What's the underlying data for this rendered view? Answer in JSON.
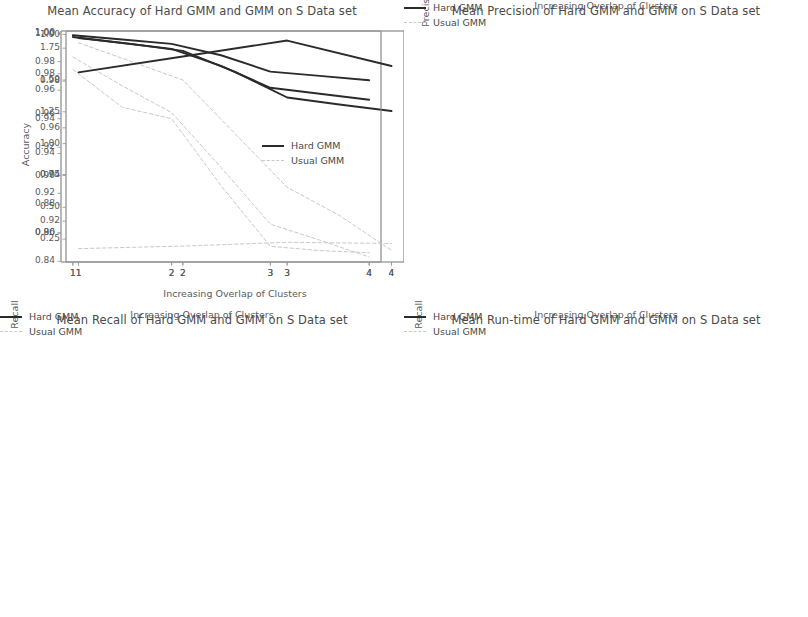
{
  "figure": {
    "background": "#ffffff",
    "series_colors": {
      "hard_gmm": "#2b2b2b",
      "usual_gmm": "#c9c9c9"
    },
    "xlabel": "Increasing Overlap of Clusters",
    "legend": {
      "hard": "Hard GMM",
      "usual": "Usual GMM"
    }
  },
  "panels": [
    {
      "id": "accuracy",
      "title": "Mean Accuracy of Hard GMM and GMM on S Data set",
      "ylabel": "Accuracy",
      "xlabel": "Increasing Overlap of Clusters",
      "xticks": [
        "1",
        "2",
        "3",
        "4"
      ],
      "yticks": [
        "1.00",
        "0.98",
        "0.96",
        "0.94",
        "0.92",
        "0.90",
        "0.88",
        "0.86",
        "0.84"
      ],
      "legend_items": [
        "Hard GMM",
        "Usual GMM"
      ]
    },
    {
      "id": "precision",
      "title": "Mean Precision of Hard GMM and GMM on S Data set",
      "ylabel": "Precision",
      "xlabel": "Increasing Overlap of Clusters",
      "xticks": [
        "1",
        "2",
        "3",
        "4"
      ],
      "yticks": [
        "1.00",
        "0.98",
        "0.96",
        "0.94",
        "0.92"
      ],
      "legend_items": [
        "Hard GMM",
        "Usual GMM"
      ]
    },
    {
      "id": "recall",
      "title": "Mean Recall of Hard GMM and GMM on S Data set",
      "ylabel": "Recall",
      "xlabel": "Increasing Overlap of Clusters",
      "xticks": [
        "1",
        "2",
        "3",
        "4"
      ],
      "yticks": [
        "1.00",
        "0.98",
        "0.96",
        "0.94",
        "0.92",
        "0.90"
      ],
      "legend_items": [
        "Hard GMM",
        "Usual GMM"
      ]
    },
    {
      "id": "runtime",
      "title": "Mean Run-time of Hard GMM and GMM on S Data set",
      "ylabel": "Recall",
      "xlabel": "Increasing Overlap of Clusters",
      "xticks": [
        "1",
        "2",
        "3",
        "4"
      ],
      "yticks": [
        "1.75",
        "1.50",
        "1.25",
        "1.00",
        "0.75",
        "0.50",
        "0.25"
      ],
      "legend_items": [
        "Hard GMM",
        "Usual GMM"
      ]
    }
  ],
  "chart_data": [
    {
      "type": "line",
      "id": "accuracy",
      "title": "Mean Accuracy of Hard GMM and GMM on S Data set",
      "xlabel": "Increasing Overlap of Clusters",
      "ylabel": "Accuracy",
      "x": [
        1,
        2,
        3,
        4
      ],
      "xticks": [
        1,
        2,
        3,
        4
      ],
      "yticks": [
        1.0,
        0.98,
        0.96,
        0.94,
        0.92,
        0.9,
        0.88,
        0.86,
        0.84
      ],
      "xlim": [
        0.88,
        4.12
      ],
      "ylim": [
        0.8395,
        1.0015
      ],
      "grid": false,
      "legend": "upper right",
      "series": [
        {
          "name": "Hard GMM",
          "style": "solid",
          "color": "#2b2b2b",
          "x": [
            1,
            1.5,
            2,
            2.5,
            3,
            3.5,
            4
          ],
          "values": [
            0.9985,
            0.9955,
            0.9925,
            0.9845,
            0.973,
            0.97,
            0.967
          ]
        },
        {
          "name": "Usual GMM",
          "style": "dashed",
          "color": "#c9c9c9",
          "x": [
            1,
            1.5,
            2,
            2.5,
            3,
            3.5,
            4
          ],
          "values": [
            0.9745,
            0.948,
            0.94,
            0.893,
            0.8505,
            0.8475,
            0.846
          ]
        }
      ]
    },
    {
      "type": "line",
      "id": "precision",
      "title": "Mean Precision of Hard GMM and GMM on S Data set",
      "xlabel": "Increasing Overlap of Clusters",
      "ylabel": "Precision",
      "x": [
        1,
        2,
        3,
        4
      ],
      "xticks": [
        1,
        2,
        3,
        4
      ],
      "yticks": [
        1.0,
        0.98,
        0.96,
        0.94,
        0.92
      ],
      "xlim": [
        0.88,
        4.12
      ],
      "ylim": [
        0.9025,
        1.0015
      ],
      "grid": false,
      "legend": "upper right",
      "series": [
        {
          "name": "Hard GMM",
          "style": "solid",
          "color": "#2b2b2b",
          "x": [
            1,
            1.5,
            2,
            2.5,
            3,
            3.5,
            4
          ],
          "values": [
            0.9985,
            0.996,
            0.993,
            0.984,
            0.973,
            0.97,
            0.9672
          ]
        },
        {
          "name": "Usual GMM",
          "style": "dashed",
          "color": "#c9c9c9",
          "x": [
            1,
            1.5,
            2,
            2.5,
            3,
            3.5,
            4
          ],
          "values": [
            0.9965,
            0.9885,
            0.9805,
            0.9575,
            0.9345,
            0.9225,
            0.9075
          ]
        }
      ]
    },
    {
      "type": "line",
      "id": "recall",
      "title": "Mean Recall of Hard GMM and GMM on S Data set",
      "xlabel": "Increasing Overlap of Clusters",
      "ylabel": "Recall",
      "x": [
        1,
        2,
        3,
        4
      ],
      "xticks": [
        1,
        2,
        3,
        4
      ],
      "yticks": [
        1.0,
        0.98,
        0.96,
        0.94,
        0.92,
        0.9
      ],
      "xlim": [
        0.88,
        4.12
      ],
      "ylim": [
        0.8855,
        1.0015
      ],
      "grid": false,
      "legend": "upper right",
      "series": [
        {
          "name": "Hard GMM",
          "style": "solid",
          "color": "#2b2b2b",
          "x": [
            1,
            1.5,
            2,
            2.5,
            3,
            3.5,
            4
          ],
          "values": [
            0.9985,
            0.9955,
            0.9925,
            0.984,
            0.973,
            0.97,
            0.967
          ]
        },
        {
          "name": "Usual GMM",
          "style": "dashed",
          "color": "#c9c9c9",
          "x": [
            1,
            1.5,
            2,
            2.5,
            3,
            3.5,
            4
          ],
          "values": [
            0.9885,
            0.974,
            0.9605,
            0.933,
            0.9045,
            0.8965,
            0.888
          ]
        }
      ]
    },
    {
      "type": "line",
      "id": "runtime",
      "title": "Mean Run-time of Hard GMM and GMM on S Data set",
      "xlabel": "Increasing Overlap of Clusters",
      "ylabel": "Recall",
      "x": [
        1,
        2,
        3,
        4
      ],
      "xticks": [
        1,
        2,
        3,
        4
      ],
      "yticks": [
        1.75,
        1.5,
        1.25,
        1.0,
        0.75,
        0.5,
        0.25
      ],
      "xlim": [
        0.88,
        4.12
      ],
      "ylim": [
        0.07,
        1.885
      ],
      "grid": false,
      "legend": "center right",
      "series": [
        {
          "name": "Hard GMM",
          "style": "solid",
          "color": "#2b2b2b",
          "x": [
            1,
            2,
            3,
            4
          ],
          "values": [
            1.56,
            1.685,
            1.81,
            1.61
          ]
        },
        {
          "name": "Usual GMM",
          "style": "dashed",
          "color": "#c9c9c9",
          "x": [
            1,
            2,
            3,
            4
          ],
          "values": [
            0.175,
            0.195,
            0.225,
            0.215
          ]
        }
      ]
    }
  ]
}
